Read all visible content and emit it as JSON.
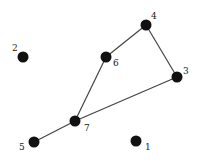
{
  "diagram": {
    "type": "undirected-graph",
    "colors": {
      "node": "#111111",
      "edge": "#444444",
      "label": "#222222",
      "background": "#ffffff"
    },
    "nodes": [
      {
        "id": "1",
        "label": "1",
        "x": 136,
        "y": 141,
        "lx": 145,
        "ly": 150
      },
      {
        "id": "2",
        "label": "2",
        "x": 23,
        "y": 57,
        "lx": 12,
        "ly": 51
      },
      {
        "id": "3",
        "label": "3",
        "x": 177,
        "y": 77,
        "lx": 183,
        "ly": 74
      },
      {
        "id": "4",
        "label": "4",
        "x": 146,
        "y": 25,
        "lx": 151,
        "ly": 19
      },
      {
        "id": "5",
        "label": "5",
        "x": 34,
        "y": 142,
        "lx": 19,
        "ly": 150
      },
      {
        "id": "6",
        "label": "6",
        "x": 106,
        "y": 57,
        "lx": 113,
        "ly": 66
      },
      {
        "id": "7",
        "label": "7",
        "x": 75,
        "y": 121,
        "lx": 84,
        "ly": 131
      }
    ],
    "edges": [
      {
        "from": "4",
        "to": "6"
      },
      {
        "from": "4",
        "to": "3"
      },
      {
        "from": "6",
        "to": "7"
      },
      {
        "from": "3",
        "to": "7"
      },
      {
        "from": "7",
        "to": "5"
      }
    ]
  }
}
